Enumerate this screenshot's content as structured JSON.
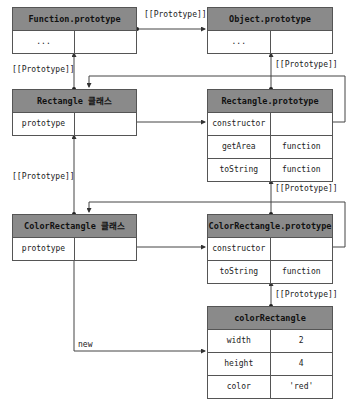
{
  "boxes": {
    "function_prototype": {
      "title": "Function.prototype",
      "rows": [
        {
          "key": "...",
          "value": ""
        }
      ]
    },
    "object_prototype": {
      "title": "Object.prototype",
      "rows": [
        {
          "key": "...",
          "value": ""
        }
      ]
    },
    "rectangle_class": {
      "title": "Rectangle 클래스",
      "rows": [
        {
          "key": "prototype",
          "value": ""
        }
      ]
    },
    "rectangle_prototype": {
      "title": "Rectangle.prototype",
      "rows": [
        {
          "key": "constructor",
          "value": ""
        },
        {
          "key": "getArea",
          "value": "function"
        },
        {
          "key": "toString",
          "value": "function"
        }
      ]
    },
    "colorrectangle_class": {
      "title": "ColorRectangle 클래스",
      "rows": [
        {
          "key": "prototype",
          "value": ""
        }
      ]
    },
    "colorrectangle_prototype": {
      "title": "ColorRectangle.prototype",
      "rows": [
        {
          "key": "constructor",
          "value": ""
        },
        {
          "key": "toString",
          "value": "function"
        }
      ]
    },
    "colorrectangle_instance": {
      "title": "colorRectangle",
      "rows": [
        {
          "key": "width",
          "value": "2"
        },
        {
          "key": "height",
          "value": "4"
        },
        {
          "key": "color",
          "value": "'red'"
        }
      ]
    }
  },
  "labels": {
    "proto_function_to_object": "[[Prototype]]",
    "proto_rectangle_to_function": "[[Prototype]]",
    "proto_rectprototype_to_object": "[[Prototype]]",
    "proto_colorrect_to_rect": "[[Prototype]]",
    "proto_colorrectprototype_to_rectprototype": "[[Prototype]]",
    "proto_instance_to_colorrectprototype": "[[Prototype]]",
    "new_label": "new"
  },
  "colors": {
    "header": "#8a8a8a",
    "border": "#555555",
    "line": "#444444"
  }
}
